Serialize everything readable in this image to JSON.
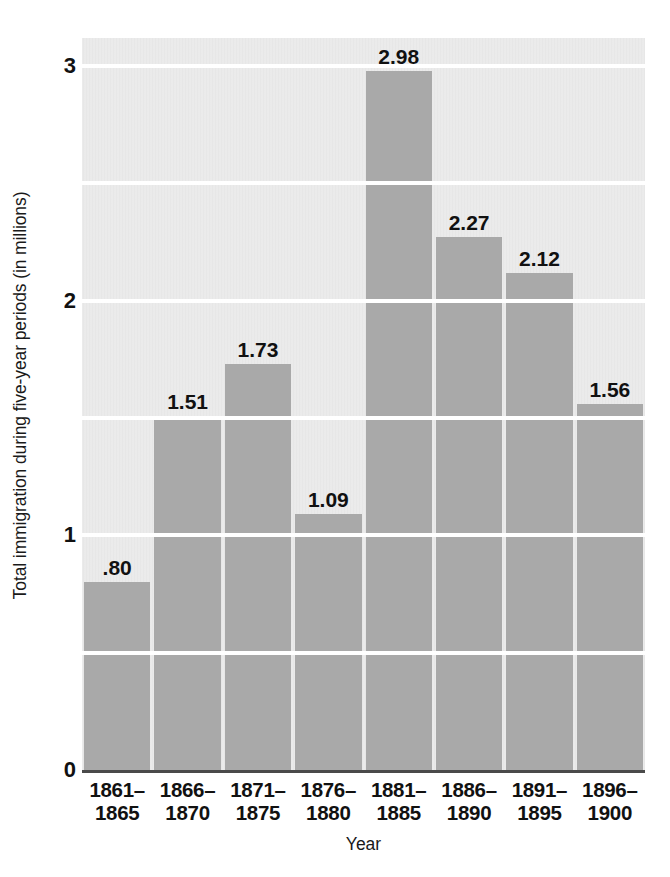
{
  "chart_data": {
    "type": "bar",
    "title": "",
    "xlabel": "Year",
    "ylabel": "Total immigration during five-year periods (in millions)",
    "categories": [
      "1861–1865",
      "1866–1870",
      "1871–1875",
      "1876–1880",
      "1881–1885",
      "1886–1890",
      "1891–1895",
      "1896–1900"
    ],
    "category_lines": [
      [
        "1861–",
        "1865"
      ],
      [
        "1866–",
        "1870"
      ],
      [
        "1871–",
        "1875"
      ],
      [
        "1876–",
        "1880"
      ],
      [
        "1881–",
        "1885"
      ],
      [
        "1886–",
        "1890"
      ],
      [
        "1891–",
        "1895"
      ],
      [
        "1896–",
        "1900"
      ]
    ],
    "values": [
      0.8,
      1.51,
      1.73,
      1.09,
      2.98,
      2.27,
      2.12,
      1.56
    ],
    "value_labels": [
      ".80",
      "1.51",
      "1.73",
      "1.09",
      "2.98",
      "2.27",
      "2.12",
      "1.56"
    ],
    "ylim": [
      0,
      3.12
    ],
    "ytick_values": [
      0,
      1,
      2,
      3
    ],
    "ytick_labels": [
      "0",
      "1",
      "2",
      "3"
    ],
    "gridlines": [
      0.5,
      1.0,
      1.5,
      2.0,
      2.5,
      3.0
    ],
    "grid": true,
    "legend": "none",
    "colors": {
      "bar": "#a9a9a9",
      "plot_background": "#e7e7e7",
      "gridline": "#ffffff",
      "axis": "#4a4a4a",
      "text": "#111111",
      "page_background": "#ffffff"
    }
  }
}
